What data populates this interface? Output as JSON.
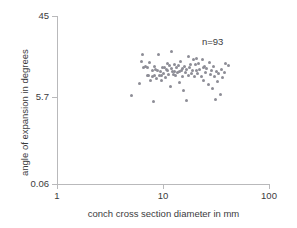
{
  "chart_data": {
    "type": "scatter",
    "title": "",
    "xlabel": "conch cross section diameter in mm",
    "ylabel": "angle of expansion in degrees",
    "xscale": "log",
    "yscale": "log",
    "xlim": [
      1,
      100
    ],
    "ylim": [
      0.06,
      45
    ],
    "xticks": [
      1,
      10,
      100
    ],
    "xtick_labels": [
      "1",
      "10",
      "100"
    ],
    "yticks": [
      0.06,
      5.7,
      45
    ],
    "ytick_labels": [
      "0.06",
      "5.7",
      "45"
    ],
    "grid": false,
    "legend": false,
    "annotations": [
      {
        "text": "n=93",
        "x": 31.5,
        "y": 26.0
      }
    ],
    "marker": {
      "shape": "circle",
      "color": "#8d8d96",
      "size_px": 3
    },
    "n_points": 93,
    "series": [
      {
        "name": "conch measurements",
        "x": [
          5.0,
          5.9,
          6.2,
          6.4,
          6.5,
          6.8,
          7.0,
          7.1,
          7.3,
          7.4,
          7.6,
          7.8,
          7.9,
          8.0,
          8.2,
          8.3,
          8.5,
          8.6,
          8.8,
          9.0,
          9.1,
          9.3,
          9.5,
          9.6,
          9.8,
          10.0,
          10.2,
          10.4,
          10.6,
          10.8,
          11.0,
          11.2,
          11.4,
          11.6,
          11.8,
          12.0,
          12.2,
          12.4,
          12.6,
          12.8,
          13.0,
          13.2,
          13.5,
          13.8,
          14.0,
          14.2,
          14.5,
          14.8,
          15.0,
          15.2,
          15.5,
          15.8,
          16.0,
          16.3,
          16.6,
          17.0,
          17.3,
          17.6,
          18.0,
          18.3,
          18.7,
          19.0,
          19.4,
          19.8,
          20.2,
          20.6,
          21.0,
          21.5,
          22.0,
          22.5,
          23.0,
          23.5,
          24.0,
          24.5,
          25.0,
          25.6,
          26.2,
          26.8,
          27.4,
          28.0,
          28.7,
          29.4,
          30.0,
          30.8,
          31.5,
          32.3,
          33.0,
          34.0,
          35.0,
          36.0,
          37.0,
          38.5,
          41.0
        ],
        "y": [
          1.95,
          3.15,
          7.45,
          9.7,
          5.95,
          6.1,
          4.4,
          5.85,
          4.25,
          7.3,
          3.6,
          4.15,
          5.3,
          1.55,
          4.35,
          6.05,
          5.55,
          3.85,
          5.25,
          9.85,
          4.4,
          5.05,
          3.5,
          4.35,
          6.0,
          4.6,
          5.85,
          4.0,
          5.45,
          7.05,
          5.2,
          4.55,
          6.3,
          2.85,
          5.7,
          11.2,
          5.05,
          4.45,
          6.75,
          5.15,
          4.3,
          5.95,
          4.8,
          6.4,
          5.1,
          3.25,
          7.6,
          5.35,
          4.15,
          5.75,
          2.4,
          6.15,
          4.95,
          5.55,
          1.6,
          4.35,
          9.1,
          5.8,
          6.65,
          4.6,
          5.25,
          7.95,
          4.1,
          6.55,
          5.35,
          8.35,
          4.75,
          6.9,
          5.45,
          4.2,
          8.05,
          5.9,
          3.55,
          6.2,
          4.85,
          5.6,
          3.05,
          7.1,
          4.45,
          5.35,
          2.55,
          6.05,
          4.2,
          1.7,
          5.1,
          3.4,
          4.65,
          2.05,
          5.55,
          3.95,
          4.85,
          6.95,
          6.35
        ]
      }
    ]
  }
}
